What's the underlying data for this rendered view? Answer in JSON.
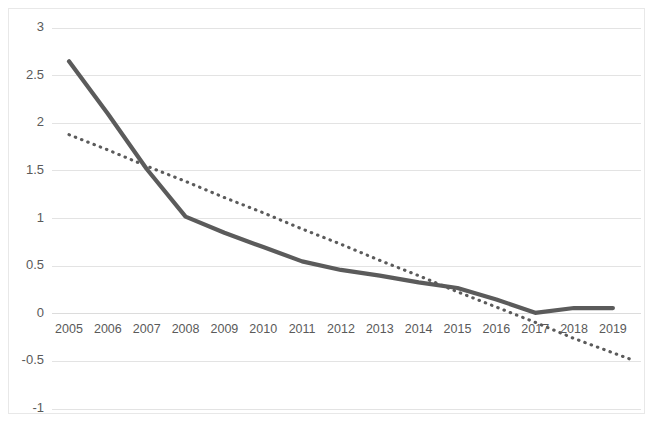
{
  "chart_data": {
    "type": "line",
    "title": "",
    "subtitle": "",
    "xlabel": "",
    "ylabel": "",
    "categories": [
      "2005",
      "2006",
      "2007",
      "2008",
      "2009",
      "2010",
      "2011",
      "2012",
      "2013",
      "2014",
      "2015",
      "2016",
      "2017",
      "2018",
      "2019"
    ],
    "series": [
      {
        "name": "series-1",
        "style": "solid",
        "color": "#5b5b5b",
        "values": [
          2.65,
          2.1,
          1.52,
          1.02,
          0.85,
          0.7,
          0.55,
          0.46,
          0.4,
          0.33,
          0.27,
          0.15,
          0.01,
          0.06,
          0.06
        ]
      },
      {
        "name": "trendline",
        "style": "dotted",
        "color": "#5b5b5b",
        "values": [
          1.88,
          1.72,
          1.55,
          1.39,
          1.22,
          1.06,
          0.89,
          0.73,
          0.56,
          0.4,
          0.23,
          0.07,
          -0.09,
          -0.26,
          -0.41
        ],
        "extends_beyond_last_category": true,
        "end_value": -0.41
      }
    ],
    "ylim": [
      -1,
      3
    ],
    "yticks": [
      "3",
      "2.5",
      "2",
      "1.5",
      "1",
      "0.5",
      "0",
      "-0.5",
      "-1"
    ],
    "ytick_values": [
      3,
      2.5,
      2,
      1.5,
      1,
      0.5,
      0,
      -0.5,
      -1
    ],
    "grid": true,
    "grid_axis": "y",
    "legend": "none",
    "gridline_color": "#e3e3e3",
    "axis_text_color": "#5a5a5a",
    "background_color": "#ffffff",
    "border_color": "#e8e8e8"
  }
}
